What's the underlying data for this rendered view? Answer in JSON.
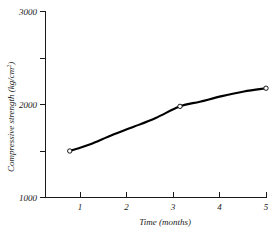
{
  "chart_data": {
    "type": "line",
    "title": "",
    "xlabel": "Time (months)",
    "ylabel": "Compressive strength (kg/cm2)",
    "ylabel_main": "Compressive strength (kg/cm",
    "ylabel_exp": "2",
    "ylabel_tail": ")",
    "xlim": [
      0,
      5
    ],
    "ylim": [
      1000,
      3000
    ],
    "grid": false,
    "legend": null,
    "x": [
      0.55,
      3.05,
      5.0
    ],
    "values": [
      1500,
      1980,
      2175
    ],
    "series": [
      {
        "name": "Compressive strength",
        "marker": "open-circle",
        "x": [
          0.55,
          3.05,
          5.0
        ],
        "values": [
          1500,
          1980,
          2175
        ]
      }
    ],
    "curve_points": [
      [
        0.55,
        1500
      ],
      [
        1.0,
        1570
      ],
      [
        1.5,
        1670
      ],
      [
        2.0,
        1760
      ],
      [
        2.5,
        1855
      ],
      [
        3.05,
        1980
      ],
      [
        3.5,
        2030
      ],
      [
        4.0,
        2090
      ],
      [
        4.5,
        2140
      ],
      [
        5.0,
        2175
      ]
    ],
    "x_ticks": [
      {
        "value": 1,
        "label": "1"
      },
      {
        "value": 2,
        "label": "2"
      },
      {
        "value": 3,
        "label": "3"
      },
      {
        "value": 4,
        "label": "4"
      },
      {
        "value": 5,
        "label": "5"
      }
    ],
    "y_ticks": [
      {
        "value": 3000,
        "label": "3000",
        "major": true
      },
      {
        "value": 2500,
        "label": "",
        "major": false
      },
      {
        "value": 2000,
        "label": "2000",
        "major": true
      },
      {
        "value": 1500,
        "label": "",
        "major": false
      },
      {
        "value": 1000,
        "label": "1000",
        "major": true
      }
    ],
    "colors": {
      "curve": "#000000",
      "axis": "#1a1a1a",
      "marker_fill": "#ffffff",
      "background": "#ffffff"
    }
  },
  "labels": {
    "y_tick_3000": "3000",
    "y_tick_2000": "2000",
    "y_tick_1000": "1000",
    "x_tick_1": "1",
    "x_tick_2": "2",
    "x_tick_3": "3",
    "x_tick_4": "4",
    "x_tick_5": "5",
    "x_axis_title": "Time (months)",
    "y_axis_title_main": "Compressive strength (kg/cm",
    "y_axis_title_exp": "2",
    "y_axis_title_tail": ")"
  }
}
